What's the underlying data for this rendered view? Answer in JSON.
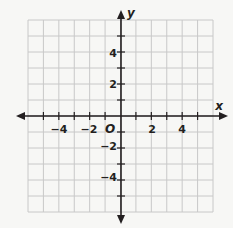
{
  "diagram": {
    "type": "coordinate-plane",
    "x_axis_label": "x",
    "y_axis_label": "y",
    "origin_label": "O",
    "grid": {
      "x_min": -6,
      "x_max": 6,
      "y_min": -6,
      "y_max": 6,
      "step": 1
    },
    "x_tick_labels": [
      {
        "value": -4,
        "text": "−4"
      },
      {
        "value": -2,
        "text": "−2"
      },
      {
        "value": 2,
        "text": "2"
      },
      {
        "value": 4,
        "text": "4"
      }
    ],
    "y_tick_labels": [
      {
        "value": 4,
        "text": "4"
      },
      {
        "value": 2,
        "text": "2"
      },
      {
        "value": -2,
        "text": "−2"
      },
      {
        "value": -4,
        "text": "−4"
      }
    ],
    "colors": {
      "grid": "#c8c8c8",
      "axis": "#231f20",
      "background": "#f7f7f5"
    }
  }
}
